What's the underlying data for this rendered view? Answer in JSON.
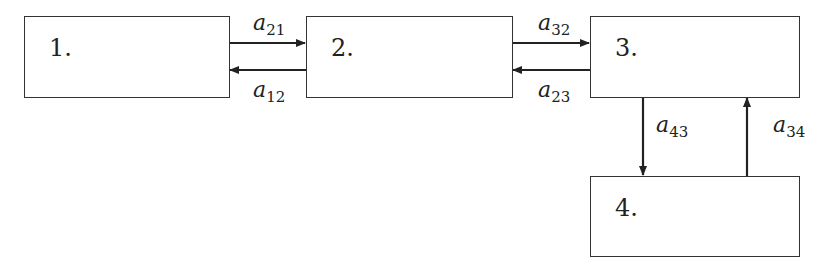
{
  "diagram": {
    "nodes": [
      {
        "id": "1",
        "label": "1."
      },
      {
        "id": "2",
        "label": "2."
      },
      {
        "id": "3",
        "label": "3."
      },
      {
        "id": "4",
        "label": "4."
      }
    ],
    "edges": [
      {
        "from": "1",
        "to": "2",
        "var": "a",
        "sub": "21"
      },
      {
        "from": "2",
        "to": "1",
        "var": "a",
        "sub": "12"
      },
      {
        "from": "2",
        "to": "3",
        "var": "a",
        "sub": "32"
      },
      {
        "from": "3",
        "to": "2",
        "var": "a",
        "sub": "23"
      },
      {
        "from": "3",
        "to": "4",
        "var": "a",
        "sub": "43"
      },
      {
        "from": "4",
        "to": "3",
        "var": "a",
        "sub": "34"
      }
    ]
  }
}
